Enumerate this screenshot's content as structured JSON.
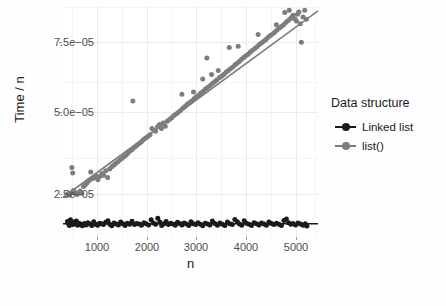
{
  "figure": {
    "background_color": "#fefefe",
    "panel_color": "#ffffff",
    "grid_major_color": "#ebebeb",
    "grid_minor_color": "#f4f4f4"
  },
  "axes": {
    "y_title": "Time / n",
    "x_title": "n",
    "y_ticks": [
      "2.5e−05",
      "5.0e−05",
      "7.5e−05"
    ],
    "x_ticks": [
      "1000",
      "2000",
      "3000",
      "4000",
      "5000"
    ]
  },
  "legend": {
    "title": "Data structure",
    "items": [
      {
        "label": "Linked list",
        "color": "#1a1a1a"
      },
      {
        "label": "list()",
        "color": "#7d7d7d"
      }
    ]
  },
  "background_text": {
    "note": "faint mirrored bleed-through from reverse of scanned page",
    "lines": [
      "the constant factor is larger. However, the",
      "linked list scales linearly, while list() does",
      "not; the gap widens as n grows larger and",
      "the quadratic behaviour of list() dominates",
      "entirely for the larger problem sizes here.",
      "",
      "",
      "",
      "",
      "",
      "",
      "",
      "",
      "",
      ""
    ]
  },
  "chart_data": {
    "type": "scatter",
    "title": "",
    "xlabel": "n",
    "ylabel": "Time / n",
    "xlim": [
      800,
      5400
    ],
    "ylim": [
      5.5e-06,
      8.75e-05
    ],
    "grid": true,
    "legend_position": "right",
    "legend_title": "Data structure",
    "series": [
      {
        "name": "Linked list",
        "color": "#1a1a1a",
        "marker": "circle",
        "has_fit_line": true,
        "fit_line": {
          "intercept": 1.02e-05,
          "slope": 0.0
        },
        "points": [
          {
            "x": 880,
            "y": 1.1e-05
          },
          {
            "x": 900,
            "y": 1.02e-05
          },
          {
            "x": 915,
            "y": 9.6e-06
          },
          {
            "x": 935,
            "y": 1.16e-05
          },
          {
            "x": 955,
            "y": 1.05e-05
          },
          {
            "x": 975,
            "y": 9.9e-06
          },
          {
            "x": 995,
            "y": 1.08e-05
          },
          {
            "x": 1015,
            "y": 1.01e-05
          },
          {
            "x": 1040,
            "y": 1.12e-05
          },
          {
            "x": 1065,
            "y": 9.7e-06
          },
          {
            "x": 1090,
            "y": 1.04e-05
          },
          {
            "x": 1120,
            "y": 1e-05
          },
          {
            "x": 1150,
            "y": 9.5e-06
          },
          {
            "x": 1185,
            "y": 1.03e-05
          },
          {
            "x": 1215,
            "y": 9.8e-06
          },
          {
            "x": 1250,
            "y": 1.06e-05
          },
          {
            "x": 1285,
            "y": 1.01e-05
          },
          {
            "x": 1320,
            "y": 9.6e-06
          },
          {
            "x": 1355,
            "y": 1.09e-05
          },
          {
            "x": 1390,
            "y": 1e-05
          },
          {
            "x": 1425,
            "y": 9.7e-06
          },
          {
            "x": 1460,
            "y": 1.04e-05
          },
          {
            "x": 1495,
            "y": 1.02e-05
          },
          {
            "x": 1530,
            "y": 9.9e-06
          },
          {
            "x": 1570,
            "y": 1.07e-05
          },
          {
            "x": 1610,
            "y": 1.13e-05
          },
          {
            "x": 1645,
            "y": 1e-05
          },
          {
            "x": 1680,
            "y": 9.5e-06
          },
          {
            "x": 1720,
            "y": 1.05e-05
          },
          {
            "x": 1760,
            "y": 1.01e-05
          },
          {
            "x": 1800,
            "y": 9.8e-06
          },
          {
            "x": 1840,
            "y": 1.08e-05
          },
          {
            "x": 1880,
            "y": 1.02e-05
          },
          {
            "x": 1920,
            "y": 9.6e-06
          },
          {
            "x": 1960,
            "y": 1.04e-05
          },
          {
            "x": 2000,
            "y": 1e-05
          },
          {
            "x": 2045,
            "y": 1.11e-05
          },
          {
            "x": 2090,
            "y": 9.9e-06
          },
          {
            "x": 2130,
            "y": 1.03e-05
          },
          {
            "x": 2175,
            "y": 1.01e-05
          },
          {
            "x": 2215,
            "y": 9.7e-06
          },
          {
            "x": 2260,
            "y": 1.06e-05
          },
          {
            "x": 2300,
            "y": 1.02e-05
          },
          {
            "x": 2345,
            "y": 9.8e-06
          },
          {
            "x": 2390,
            "y": 1.16e-05
          },
          {
            "x": 2430,
            "y": 1.05e-05
          },
          {
            "x": 2470,
            "y": 1e-05
          },
          {
            "x": 2510,
            "y": 1.22e-05
          },
          {
            "x": 2545,
            "y": 1.08e-05
          },
          {
            "x": 2580,
            "y": 9.6e-06
          },
          {
            "x": 2620,
            "y": 1.02e-05
          },
          {
            "x": 2660,
            "y": 1.1e-05
          },
          {
            "x": 2700,
            "y": 9.9e-06
          },
          {
            "x": 2740,
            "y": 1.04e-05
          },
          {
            "x": 2785,
            "y": 1.01e-05
          },
          {
            "x": 2825,
            "y": 9.7e-06
          },
          {
            "x": 2865,
            "y": 1.07e-05
          },
          {
            "x": 2905,
            "y": 1.03e-05
          },
          {
            "x": 2945,
            "y": 9.8e-06
          },
          {
            "x": 2985,
            "y": 1.05e-05
          },
          {
            "x": 3025,
            "y": 1.01e-05
          },
          {
            "x": 3070,
            "y": 9.6e-06
          },
          {
            "x": 3110,
            "y": 1.09e-05
          },
          {
            "x": 3150,
            "y": 1.02e-05
          },
          {
            "x": 3195,
            "y": 9.9e-06
          },
          {
            "x": 3235,
            "y": 1.06e-05
          },
          {
            "x": 3280,
            "y": 1e-05
          },
          {
            "x": 3320,
            "y": 9.5e-06
          },
          {
            "x": 3365,
            "y": 1.04e-05
          },
          {
            "x": 3410,
            "y": 1.01e-05
          },
          {
            "x": 3450,
            "y": 9.8e-06
          },
          {
            "x": 3495,
            "y": 1.12e-05
          },
          {
            "x": 3540,
            "y": 1.03e-05
          },
          {
            "x": 3585,
            "y": 9.7e-06
          },
          {
            "x": 3630,
            "y": 1.05e-05
          },
          {
            "x": 3675,
            "y": 1e-05
          },
          {
            "x": 3720,
            "y": 9.6e-06
          },
          {
            "x": 3765,
            "y": 1.08e-05
          },
          {
            "x": 3810,
            "y": 1.02e-05
          },
          {
            "x": 3855,
            "y": 9.9e-06
          },
          {
            "x": 3900,
            "y": 1.17e-05
          },
          {
            "x": 3945,
            "y": 1.09e-05
          },
          {
            "x": 3985,
            "y": 1.01e-05
          },
          {
            "x": 4025,
            "y": 9.7e-06
          },
          {
            "x": 4070,
            "y": 1.13e-05
          },
          {
            "x": 4110,
            "y": 1.04e-05
          },
          {
            "x": 4155,
            "y": 1e-05
          },
          {
            "x": 4200,
            "y": 9.6e-06
          },
          {
            "x": 4245,
            "y": 1.06e-05
          },
          {
            "x": 4290,
            "y": 1.02e-05
          },
          {
            "x": 4335,
            "y": 9.8e-06
          },
          {
            "x": 4380,
            "y": 1.05e-05
          },
          {
            "x": 4425,
            "y": 1.01e-05
          },
          {
            "x": 4470,
            "y": 9.7e-06
          },
          {
            "x": 4515,
            "y": 1.08e-05
          },
          {
            "x": 4560,
            "y": 1.03e-05
          },
          {
            "x": 4605,
            "y": 9.9e-06
          },
          {
            "x": 4650,
            "y": 1.04e-05
          },
          {
            "x": 4695,
            "y": 1e-05
          },
          {
            "x": 4740,
            "y": 9.6e-06
          },
          {
            "x": 4785,
            "y": 1.14e-05
          },
          {
            "x": 4830,
            "y": 1.19e-05
          },
          {
            "x": 4870,
            "y": 1.06e-05
          },
          {
            "x": 4910,
            "y": 1e-05
          },
          {
            "x": 4950,
            "y": 1.03e-05
          },
          {
            "x": 4995,
            "y": 9.8e-06
          },
          {
            "x": 5040,
            "y": 1.05e-05
          },
          {
            "x": 5085,
            "y": 1.01e-05
          },
          {
            "x": 5130,
            "y": 9.7e-06
          },
          {
            "x": 5170,
            "y": 1.02e-05
          },
          {
            "x": 5200,
            "y": 9.4e-06
          }
        ]
      },
      {
        "name": "list()",
        "color": "#7d7d7d",
        "marker": "circle",
        "has_fit_line": true,
        "fit_line": {
          "intercept": 8e-06,
          "slope": 1.44e-08
        },
        "points": [
          {
            "x": 880,
            "y": 2.06e-05
          },
          {
            "x": 900,
            "y": 2.1e-05
          },
          {
            "x": 920,
            "y": 2.04e-05
          },
          {
            "x": 945,
            "y": 2.12e-05
          },
          {
            "x": 960,
            "y": 3.02e-05
          },
          {
            "x": 975,
            "y": 2.82e-05
          },
          {
            "x": 990,
            "y": 2.2e-05
          },
          {
            "x": 1010,
            "y": 2.14e-05
          },
          {
            "x": 1030,
            "y": 2.08e-05
          },
          {
            "x": 1055,
            "y": 2.06e-05
          },
          {
            "x": 1080,
            "y": 2.12e-05
          },
          {
            "x": 1110,
            "y": 2.18e-05
          },
          {
            "x": 1140,
            "y": 2.1e-05
          },
          {
            "x": 1170,
            "y": 2.34e-05
          },
          {
            "x": 1200,
            "y": 2.4e-05
          },
          {
            "x": 1235,
            "y": 2.48e-05
          },
          {
            "x": 1270,
            "y": 2.56e-05
          },
          {
            "x": 1300,
            "y": 2.86e-05
          },
          {
            "x": 1330,
            "y": 2.62e-05
          },
          {
            "x": 1365,
            "y": 2.66e-05
          },
          {
            "x": 1400,
            "y": 2.72e-05
          },
          {
            "x": 1430,
            "y": 2.58e-05
          },
          {
            "x": 1465,
            "y": 2.7e-05
          },
          {
            "x": 1500,
            "y": 2.8e-05
          },
          {
            "x": 1535,
            "y": 2.74e-05
          },
          {
            "x": 1570,
            "y": 2.9e-05
          },
          {
            "x": 1605,
            "y": 2.66e-05
          },
          {
            "x": 1640,
            "y": 2.96e-05
          },
          {
            "x": 1680,
            "y": 3.04e-05
          },
          {
            "x": 1715,
            "y": 3.1e-05
          },
          {
            "x": 1750,
            "y": 3.16e-05
          },
          {
            "x": 1790,
            "y": 3.22e-05
          },
          {
            "x": 1825,
            "y": 3.28e-05
          },
          {
            "x": 1860,
            "y": 3.34e-05
          },
          {
            "x": 1900,
            "y": 3.4e-05
          },
          {
            "x": 1940,
            "y": 3.46e-05
          },
          {
            "x": 1975,
            "y": 3.54e-05
          },
          {
            "x": 2010,
            "y": 3.6e-05
          },
          {
            "x": 2050,
            "y": 3.66e-05
          },
          {
            "x": 2060,
            "y": 5.38e-05
          },
          {
            "x": 2090,
            "y": 3.74e-05
          },
          {
            "x": 2130,
            "y": 3.8e-05
          },
          {
            "x": 2170,
            "y": 3.86e-05
          },
          {
            "x": 2210,
            "y": 3.92e-05
          },
          {
            "x": 2250,
            "y": 4e-05
          },
          {
            "x": 2290,
            "y": 4.06e-05
          },
          {
            "x": 2330,
            "y": 4.12e-05
          },
          {
            "x": 2370,
            "y": 4.18e-05
          },
          {
            "x": 2405,
            "y": 4.4e-05
          },
          {
            "x": 2440,
            "y": 4.34e-05
          },
          {
            "x": 2470,
            "y": 4.3e-05
          },
          {
            "x": 2505,
            "y": 4.46e-05
          },
          {
            "x": 2540,
            "y": 4.54e-05
          },
          {
            "x": 2575,
            "y": 4.4e-05
          },
          {
            "x": 2610,
            "y": 4.6e-05
          },
          {
            "x": 2645,
            "y": 4.48e-05
          },
          {
            "x": 2680,
            "y": 4.66e-05
          },
          {
            "x": 2720,
            "y": 4.72e-05
          },
          {
            "x": 2760,
            "y": 4.78e-05
          },
          {
            "x": 2800,
            "y": 4.86e-05
          },
          {
            "x": 2840,
            "y": 4.92e-05
          },
          {
            "x": 2880,
            "y": 4.98e-05
          },
          {
            "x": 2920,
            "y": 5.04e-05
          },
          {
            "x": 2945,
            "y": 5.62e-05
          },
          {
            "x": 2960,
            "y": 5.12e-05
          },
          {
            "x": 3000,
            "y": 5.18e-05
          },
          {
            "x": 3040,
            "y": 5.26e-05
          },
          {
            "x": 3080,
            "y": 5.32e-05
          },
          {
            "x": 3120,
            "y": 5.38e-05
          },
          {
            "x": 3155,
            "y": 5.7e-05
          },
          {
            "x": 3165,
            "y": 5.46e-05
          },
          {
            "x": 3200,
            "y": 5.52e-05
          },
          {
            "x": 3245,
            "y": 5.58e-05
          },
          {
            "x": 3285,
            "y": 5.66e-05
          },
          {
            "x": 3320,
            "y": 6.16e-05
          },
          {
            "x": 3330,
            "y": 5.72e-05
          },
          {
            "x": 3370,
            "y": 5.8e-05
          },
          {
            "x": 3395,
            "y": 6.9e-05
          },
          {
            "x": 3410,
            "y": 5.86e-05
          },
          {
            "x": 3450,
            "y": 5.92e-05
          },
          {
            "x": 3480,
            "y": 6.32e-05
          },
          {
            "x": 3495,
            "y": 6e-05
          },
          {
            "x": 3535,
            "y": 6.06e-05
          },
          {
            "x": 3575,
            "y": 6.12e-05
          },
          {
            "x": 3600,
            "y": 6.46e-05
          },
          {
            "x": 3620,
            "y": 6.2e-05
          },
          {
            "x": 3660,
            "y": 6.26e-05
          },
          {
            "x": 3700,
            "y": 6.32e-05
          },
          {
            "x": 3740,
            "y": 6.4e-05
          },
          {
            "x": 3780,
            "y": 6.46e-05
          },
          {
            "x": 3800,
            "y": 7.28e-05
          },
          {
            "x": 3820,
            "y": 6.52e-05
          },
          {
            "x": 3860,
            "y": 6.58e-05
          },
          {
            "x": 3900,
            "y": 6.66e-05
          },
          {
            "x": 3940,
            "y": 6.72e-05
          },
          {
            "x": 3960,
            "y": 7.32e-05
          },
          {
            "x": 3980,
            "y": 6.78e-05
          },
          {
            "x": 4020,
            "y": 6.86e-05
          },
          {
            "x": 4060,
            "y": 6.92e-05
          },
          {
            "x": 4100,
            "y": 6.98e-05
          },
          {
            "x": 4140,
            "y": 7.04e-05
          },
          {
            "x": 4180,
            "y": 7.12e-05
          },
          {
            "x": 4220,
            "y": 7.18e-05
          },
          {
            "x": 4260,
            "y": 7.24e-05
          },
          {
            "x": 4300,
            "y": 7.3e-05
          },
          {
            "x": 4320,
            "y": 7.74e-05
          },
          {
            "x": 4340,
            "y": 7.38e-05
          },
          {
            "x": 4380,
            "y": 7.44e-05
          },
          {
            "x": 4420,
            "y": 7.5e-05
          },
          {
            "x": 4460,
            "y": 7.56e-05
          },
          {
            "x": 4500,
            "y": 7.64e-05
          },
          {
            "x": 4540,
            "y": 7.7e-05
          },
          {
            "x": 4580,
            "y": 7.76e-05
          },
          {
            "x": 4620,
            "y": 7.82e-05
          },
          {
            "x": 4650,
            "y": 8.08e-05
          },
          {
            "x": 4660,
            "y": 7.9e-05
          },
          {
            "x": 4700,
            "y": 7.96e-05
          },
          {
            "x": 4740,
            "y": 8.02e-05
          },
          {
            "x": 4780,
            "y": 8.08e-05
          },
          {
            "x": 4800,
            "y": 8.52e-05
          },
          {
            "x": 4820,
            "y": 8.16e-05
          },
          {
            "x": 4850,
            "y": 8.22e-05
          },
          {
            "x": 4880,
            "y": 8.6e-05
          },
          {
            "x": 4890,
            "y": 8.28e-05
          },
          {
            "x": 4920,
            "y": 8.34e-05
          },
          {
            "x": 4950,
            "y": 8.42e-05
          },
          {
            "x": 4980,
            "y": 8.3e-05
          },
          {
            "x": 5010,
            "y": 8.22e-05
          },
          {
            "x": 5030,
            "y": 8.46e-05
          },
          {
            "x": 5055,
            "y": 8.54e-05
          },
          {
            "x": 5080,
            "y": 8.12e-05
          },
          {
            "x": 5100,
            "y": 7.46e-05
          },
          {
            "x": 5130,
            "y": 8.36e-05
          },
          {
            "x": 5160,
            "y": 8.6e-05
          },
          {
            "x": 5190,
            "y": 8.28e-05
          }
        ]
      }
    ]
  }
}
